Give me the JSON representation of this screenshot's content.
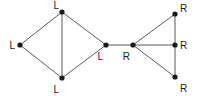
{
  "figure": {
    "name": "two-cluster-graph-diagram",
    "type": "node-link-diagram",
    "width": 198,
    "height": 96,
    "background_color": "#ffffff",
    "edge_color": "#5a5a5a",
    "node_color": "#1a1a1a",
    "label_color": "#1a1a1a",
    "node_radius": 2.6,
    "edge_width": 1,
    "label_font_size": 10
  },
  "graph_data": {
    "type": "node-link",
    "node_count": 8,
    "edge_count": 10,
    "label_values": [
      "L",
      "R"
    ],
    "nodes": [
      {
        "id": "l-top",
        "label": "L",
        "x": 62,
        "y": 12,
        "label_x": 59,
        "label_y": 9,
        "label_anchor": "end",
        "label_baseline": "alphabetic",
        "cluster": "left"
      },
      {
        "id": "l-left",
        "label": "L",
        "x": 20,
        "y": 45,
        "label_x": 15,
        "label_y": 49,
        "label_anchor": "end",
        "label_baseline": "alphabetic",
        "cluster": "left"
      },
      {
        "id": "l-bottom",
        "label": "L",
        "x": 62,
        "y": 78,
        "label_x": 59,
        "label_y": 93,
        "label_anchor": "end",
        "label_baseline": "alphabetic",
        "cluster": "left"
      },
      {
        "id": "l-center",
        "label": "L",
        "x": 106,
        "y": 45,
        "label_x": 103,
        "label_y": 60,
        "label_anchor": "end",
        "label_baseline": "alphabetic",
        "cluster": "left"
      },
      {
        "id": "r-center",
        "label": "R",
        "x": 133,
        "y": 45,
        "label_x": 130,
        "label_y": 60,
        "label_anchor": "end",
        "label_baseline": "alphabetic",
        "cluster": "right"
      },
      {
        "id": "r-top",
        "label": "R",
        "x": 175,
        "y": 14,
        "label_x": 180,
        "label_y": 12,
        "label_anchor": "start",
        "label_baseline": "alphabetic",
        "cluster": "right"
      },
      {
        "id": "r-mid",
        "label": "R",
        "x": 175,
        "y": 45,
        "label_x": 180,
        "label_y": 49,
        "label_anchor": "start",
        "label_baseline": "alphabetic",
        "cluster": "right"
      },
      {
        "id": "r-bottom",
        "label": "R",
        "x": 175,
        "y": 77,
        "label_x": 180,
        "label_y": 92,
        "label_anchor": "start",
        "label_baseline": "alphabetic",
        "cluster": "right"
      }
    ],
    "edges": [
      {
        "id": "e1",
        "source": "l-left",
        "target": "l-top"
      },
      {
        "id": "e2",
        "source": "l-left",
        "target": "l-bottom"
      },
      {
        "id": "e3",
        "source": "l-top",
        "target": "l-bottom"
      },
      {
        "id": "e4",
        "source": "l-top",
        "target": "l-center"
      },
      {
        "id": "e5",
        "source": "l-bottom",
        "target": "l-center"
      },
      {
        "id": "e6",
        "source": "l-center",
        "target": "r-center"
      },
      {
        "id": "e7",
        "source": "r-center",
        "target": "r-top"
      },
      {
        "id": "e8",
        "source": "r-center",
        "target": "r-mid"
      },
      {
        "id": "e9",
        "source": "r-center",
        "target": "r-bottom"
      },
      {
        "id": "e10",
        "source": "r-top",
        "target": "r-bottom"
      }
    ]
  }
}
